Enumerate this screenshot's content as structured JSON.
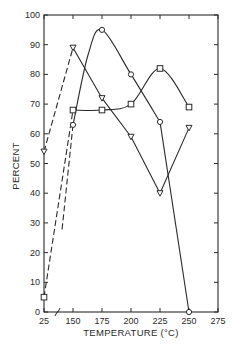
{
  "chart_data": {
    "type": "line",
    "title": "",
    "xlabel": "TEMPERATURE (°C)",
    "ylabel": "PERCENT",
    "x_ticks": [
      "25",
      "150",
      "175",
      "200",
      "225",
      "250",
      "275"
    ],
    "y_ticks": [
      "0",
      "10",
      "20",
      "30",
      "40",
      "50",
      "60",
      "70",
      "80",
      "90",
      "100"
    ],
    "x_axis_break": "between 25 and 150",
    "ylim": [
      0,
      100
    ],
    "grid": false,
    "legend": null,
    "series": [
      {
        "name": "circles",
        "marker": "circle",
        "x": [
          150,
          175,
          200,
          225,
          250
        ],
        "values": [
          63,
          95,
          80,
          64,
          0
        ],
        "line": "solid smooth curve"
      },
      {
        "name": "squares",
        "marker": "square",
        "x": [
          25,
          150,
          175,
          200,
          225,
          250
        ],
        "values": [
          5,
          68,
          68,
          70,
          82,
          69
        ],
        "line": "dashed 25→150, then solid smooth curve"
      },
      {
        "name": "triangles",
        "marker": "triangle-down",
        "x": [
          25,
          150,
          175,
          200,
          225,
          250
        ],
        "values": [
          54,
          89,
          72,
          59,
          40,
          62
        ],
        "line": "dashed 25→150, then solid straight segments"
      }
    ]
  },
  "colors": {
    "ink": "#2a2a2a",
    "background": "#ffffff"
  }
}
